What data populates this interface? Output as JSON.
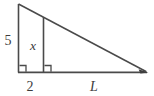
{
  "figure": {
    "type": "geometry-diagram",
    "background_color": "#ffffff",
    "stroke_color": "#4a4a4a",
    "text_color": "#3c3c3c",
    "labels": {
      "left_side": "5",
      "inner_height": "x",
      "near_base": "2",
      "far_base": "L"
    },
    "label_styles": {
      "left_side": "upright",
      "inner_height": "italic",
      "near_base": "upright",
      "far_base": "italic"
    },
    "geometry": {
      "apex": [
        18,
        4
      ],
      "base_left": [
        18,
        72
      ],
      "base_right": [
        147,
        72
      ],
      "inner_top": [
        43,
        17
      ],
      "inner_bottom": [
        43,
        72
      ],
      "right_angle_marks": [
        [
          18,
          72
        ],
        [
          43,
          72
        ]
      ],
      "arrowhead_at": [
        147,
        72
      ]
    },
    "annotations": {
      "left_side_position": [
        8,
        40
      ],
      "inner_height_position": [
        33,
        46
      ],
      "near_base_position": [
        30,
        88
      ],
      "far_base_position": [
        94,
        88
      ]
    }
  }
}
